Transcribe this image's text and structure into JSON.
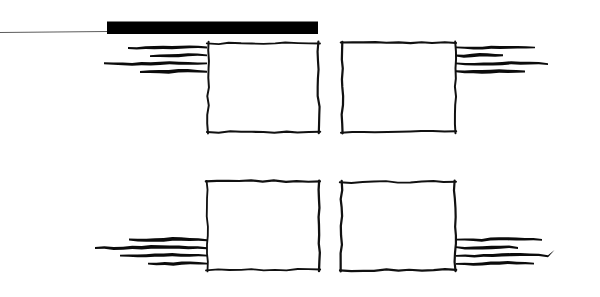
{
  "document": {
    "kind": "hand-drawn-sketch-diagram",
    "background_color": "#ffffff",
    "ink_color": "#0b0b0b",
    "width": 600,
    "height": 297,
    "description_label": "Hand drawn wireframe sketch with four panels and annotation strokes"
  },
  "leader": {
    "name_label": "leader-line",
    "color": "#4a4a4a",
    "x1": 0,
    "y1": 32.5,
    "x2": 107,
    "y2": 31.5,
    "thickness": 0.9
  },
  "title_bar": {
    "name_label": "title-bar",
    "color": "#000000",
    "x": 107,
    "y": 21.5,
    "width": 211,
    "height": 12.5
  },
  "panels": [
    {
      "id": "panel-top-left",
      "label": "top-left-panel",
      "x": 208,
      "y": 43,
      "width": 111,
      "height": 89,
      "stroke_width": 2.1
    },
    {
      "id": "panel-top-right",
      "label": "top-right-panel",
      "x": 342,
      "y": 43,
      "width": 113,
      "height": 89,
      "stroke_width": 2.1
    },
    {
      "id": "panel-bottom-left",
      "label": "bottom-left-panel",
      "x": 207,
      "y": 182,
      "width": 112,
      "height": 88,
      "stroke_width": 2.1
    },
    {
      "id": "panel-bottom-right",
      "label": "bottom-right-panel",
      "x": 341,
      "y": 182,
      "width": 114,
      "height": 88,
      "stroke_width": 2.1
    }
  ],
  "annotation_groups": [
    {
      "id": "annot-top-left",
      "label": "top-left-annotation-lines",
      "align": "right",
      "anchor_x": 207,
      "thickness": 3.4,
      "lines": [
        {
          "y": 47.5,
          "start_x": 128,
          "end_x": 207,
          "curl": "none"
        },
        {
          "y": 55.5,
          "start_x": 150,
          "end_x": 207,
          "curl": "none"
        },
        {
          "y": 63.5,
          "start_x": 104,
          "end_x": 207,
          "curl": "none"
        },
        {
          "y": 71.5,
          "start_x": 140,
          "end_x": 207,
          "curl": "none"
        }
      ]
    },
    {
      "id": "annot-top-right",
      "label": "top-right-annotation-lines",
      "align": "left",
      "anchor_x": 456,
      "thickness": 3.4,
      "lines": [
        {
          "y": 47.5,
          "start_x": 456,
          "end_x": 535,
          "curl": "none"
        },
        {
          "y": 55.5,
          "start_x": 456,
          "end_x": 503,
          "curl": "none"
        },
        {
          "y": 63.5,
          "start_x": 456,
          "end_x": 548,
          "curl": "none"
        },
        {
          "y": 71.5,
          "start_x": 456,
          "end_x": 525,
          "curl": "none"
        }
      ]
    },
    {
      "id": "annot-bottom-left",
      "label": "bottom-left-annotation-lines",
      "align": "right",
      "anchor_x": 207,
      "thickness": 3.4,
      "lines": [
        {
          "y": 239.5,
          "start_x": 129,
          "end_x": 207,
          "curl": "none"
        },
        {
          "y": 247.5,
          "start_x": 95,
          "end_x": 207,
          "curl": "none"
        },
        {
          "y": 255.5,
          "start_x": 120,
          "end_x": 207,
          "curl": "none"
        },
        {
          "y": 263.5,
          "start_x": 148,
          "end_x": 207,
          "curl": "none"
        }
      ]
    },
    {
      "id": "annot-bottom-right",
      "label": "bottom-right-annotation-lines",
      "align": "left",
      "anchor_x": 456,
      "thickness": 3.4,
      "lines": [
        {
          "y": 239.5,
          "start_x": 456,
          "end_x": 542,
          "curl": "none"
        },
        {
          "y": 247.5,
          "start_x": 456,
          "end_x": 518,
          "curl": "none"
        },
        {
          "y": 255.5,
          "start_x": 456,
          "end_x": 548,
          "curl": "up-hook"
        },
        {
          "y": 263.5,
          "start_x": 456,
          "end_x": 534,
          "curl": "none"
        }
      ]
    }
  ]
}
